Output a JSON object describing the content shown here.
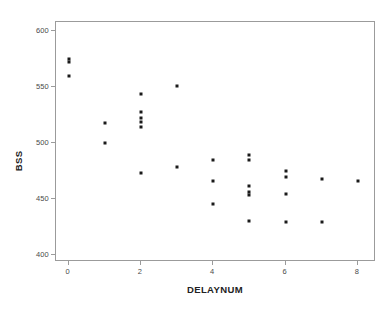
{
  "chart_data": {
    "type": "scatter",
    "title": "",
    "xlabel": "DELAYNUM",
    "ylabel": "BSS",
    "xlim": [
      -0.35,
      8.5
    ],
    "ylim": [
      394,
      608
    ],
    "grid": false,
    "legend": null,
    "xticks": [
      0,
      2,
      4,
      6,
      8
    ],
    "xtick_labels": [
      "0",
      "2",
      "4",
      "6",
      "8"
    ],
    "yticks": [
      400,
      450,
      500,
      550,
      600
    ],
    "ytick_labels": [
      "400",
      "450",
      "500",
      "550",
      "600"
    ],
    "marker": "filled-square",
    "marker_color": "#1a1a1a",
    "points": [
      {
        "x": 0,
        "y": 575
      },
      {
        "x": 0,
        "y": 572
      },
      {
        "x": 0,
        "y": 560
      },
      {
        "x": 1,
        "y": 518
      },
      {
        "x": 1,
        "y": 500
      },
      {
        "x": 2,
        "y": 544
      },
      {
        "x": 2,
        "y": 528
      },
      {
        "x": 2,
        "y": 522
      },
      {
        "x": 2,
        "y": 519
      },
      {
        "x": 2,
        "y": 514
      },
      {
        "x": 2,
        "y": 473
      },
      {
        "x": 3,
        "y": 551
      },
      {
        "x": 3,
        "y": 479
      },
      {
        "x": 4,
        "y": 485
      },
      {
        "x": 4,
        "y": 466
      },
      {
        "x": 4,
        "y": 446
      },
      {
        "x": 5,
        "y": 489
      },
      {
        "x": 5,
        "y": 485
      },
      {
        "x": 5,
        "y": 462
      },
      {
        "x": 5,
        "y": 456
      },
      {
        "x": 5,
        "y": 454
      },
      {
        "x": 5,
        "y": 431
      },
      {
        "x": 6,
        "y": 475
      },
      {
        "x": 6,
        "y": 470
      },
      {
        "x": 6,
        "y": 455
      },
      {
        "x": 6,
        "y": 430
      },
      {
        "x": 7,
        "y": 468
      },
      {
        "x": 7,
        "y": 430
      },
      {
        "x": 8,
        "y": 466
      }
    ]
  }
}
